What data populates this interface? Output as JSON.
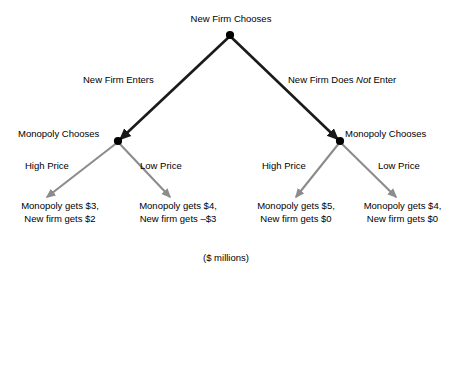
{
  "diagram": {
    "units_caption": "($ millions)",
    "colors": {
      "level1_branch": "#1a1a1a",
      "level2_branch": "#8c8c8c",
      "node_fill": "#000000",
      "text": "#000000",
      "background": "#ffffff"
    },
    "root": {
      "label": "New Firm Chooses",
      "node_name": "root-decision-node"
    },
    "level1_branches": [
      {
        "label": "New Firm Enters",
        "italic_word": "",
        "side": "left"
      },
      {
        "label_prefix": "New Firm Does ",
        "italic_word": "Not",
        "label_suffix": " Enter",
        "side": "right"
      }
    ],
    "decision_nodes": [
      {
        "label": "Monopoly Chooses",
        "side": "left"
      },
      {
        "label": "Monopoly Chooses",
        "side": "right"
      }
    ],
    "level2_branches": [
      {
        "label": "High Price",
        "parent": "left"
      },
      {
        "label": "Low Price",
        "parent": "left"
      },
      {
        "label": "High Price",
        "parent": "right"
      },
      {
        "label": "Low Price",
        "parent": "right"
      }
    ],
    "outcomes": [
      {
        "path": "Enter / High Price",
        "monopoly_line": "Monopoly gets $3,",
        "newfirm_line": "New firm gets $2",
        "monopoly_payoff": 3,
        "newfirm_payoff": 2
      },
      {
        "path": "Enter / Low Price",
        "monopoly_line": "Monopoly gets $4,",
        "newfirm_line": "New firm gets –$3",
        "monopoly_payoff": 4,
        "newfirm_payoff": -3
      },
      {
        "path": "Does Not Enter / High Price",
        "monopoly_line": "Monopoly gets $5,",
        "newfirm_line": "New firm gets $0",
        "monopoly_payoff": 5,
        "newfirm_payoff": 0
      },
      {
        "path": "Does Not Enter / Low Price",
        "monopoly_line": "Monopoly gets $4,",
        "newfirm_line": "New firm gets $0",
        "monopoly_payoff": 4,
        "newfirm_payoff": 0
      }
    ]
  }
}
